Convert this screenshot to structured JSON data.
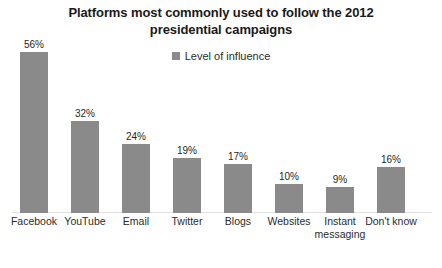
{
  "chart_data": {
    "type": "bar",
    "title": "Platforms most commonly used to follow the 2012 presidential campaigns",
    "title_line1": "Platforms most commonly used to follow the 2012",
    "title_line2": "presidential campaigns",
    "xlabel": "",
    "ylabel": "",
    "ylim": [
      0,
      60
    ],
    "grid": false,
    "legend_position": "top-center",
    "legend": [
      "Level of influence"
    ],
    "series_name": "Level of influence",
    "bar_color": "#8a8a8a",
    "categories": [
      "Facebook",
      "YouTube",
      "Email",
      "Twitter",
      "Blogs",
      "Websites",
      "Instant messaging",
      "Don't know"
    ],
    "values": [
      56,
      32,
      24,
      19,
      17,
      10,
      9,
      16
    ],
    "value_labels": [
      "56%",
      "32%",
      "24%",
      "19%",
      "17%",
      "10%",
      "9%",
      "16%"
    ],
    "bars": [
      {
        "category": "Facebook",
        "label_line1": "Facebook",
        "label_line2": "",
        "value": 56,
        "value_label": "56%"
      },
      {
        "category": "YouTube",
        "label_line1": "YouTube",
        "label_line2": "",
        "value": 32,
        "value_label": "32%"
      },
      {
        "category": "Email",
        "label_line1": "Email",
        "label_line2": "",
        "value": 24,
        "value_label": "24%"
      },
      {
        "category": "Twitter",
        "label_line1": "Twitter",
        "label_line2": "",
        "value": 19,
        "value_label": "19%"
      },
      {
        "category": "Blogs",
        "label_line1": "Blogs",
        "label_line2": "",
        "value": 17,
        "value_label": "17%"
      },
      {
        "category": "Websites",
        "label_line1": "Websites",
        "label_line2": "",
        "value": 10,
        "value_label": "10%"
      },
      {
        "category": "Instant messaging",
        "label_line1": "Instant",
        "label_line2": "messaging",
        "value": 9,
        "value_label": "9%"
      },
      {
        "category": "Don't know",
        "label_line1": "Don't know",
        "label_line2": "",
        "value": 16,
        "value_label": "16%"
      }
    ]
  }
}
